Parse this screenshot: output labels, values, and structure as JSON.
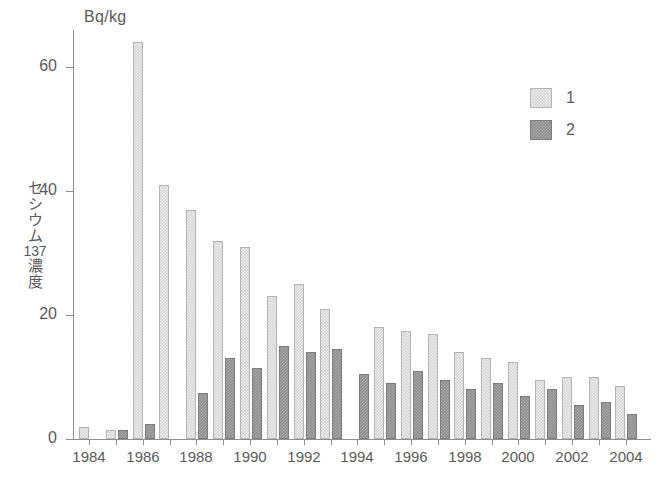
{
  "chart_data": {
    "type": "bar",
    "title": "",
    "subtitle": "",
    "unit_caption": "Bq/kg",
    "ylabel": "セシウム137濃度",
    "ylabel_parts": [
      "セ",
      "シ",
      "ウ",
      "ム",
      "137",
      "濃",
      "度"
    ],
    "xlabel": "",
    "ylim": [
      0,
      66
    ],
    "yticks": [
      0,
      20,
      40,
      60
    ],
    "ytick_labels": [
      "0",
      "20",
      "40",
      "60"
    ],
    "grid": false,
    "legend_position": "top-right",
    "categories": [
      "1984",
      "1985",
      "1986",
      "1987",
      "1988",
      "1989",
      "1990",
      "1991",
      "1992",
      "1993",
      "1994",
      "1995",
      "1996",
      "1997",
      "1998",
      "1999",
      "2000",
      "2001",
      "2002",
      "2003",
      "2004"
    ],
    "xtick_labels": [
      "1984",
      "1986",
      "1988",
      "1990",
      "1992",
      "1994",
      "1996",
      "1998",
      "2000",
      "2002",
      "2004"
    ],
    "xtick_categories": [
      "1984",
      "1986",
      "1988",
      "1990",
      "1992",
      "1994",
      "1996",
      "1998",
      "2000",
      "2002",
      "2004"
    ],
    "series": [
      {
        "name": "1",
        "color": "#d7d7d7",
        "values": [
          2.0,
          1.5,
          64.0,
          41.0,
          37.0,
          32.0,
          31.0,
          23.0,
          25.0,
          21.0,
          null,
          18.0,
          17.5,
          17.0,
          14.0,
          13.0,
          12.5,
          9.5,
          10.0,
          10.0,
          8.5
        ]
      },
      {
        "name": "2",
        "color": "#8f8f8f",
        "values": [
          null,
          1.5,
          2.5,
          null,
          7.5,
          13.0,
          11.5,
          15.0,
          14.0,
          14.5,
          10.5,
          9.0,
          11.0,
          9.5,
          8.0,
          9.0,
          7.0,
          8.0,
          5.5,
          6.0,
          4.0
        ]
      }
    ]
  },
  "legend": {
    "items": [
      {
        "label": "1",
        "color": "#d7d7d7"
      },
      {
        "label": "2",
        "color": "#8f8f8f"
      }
    ]
  }
}
